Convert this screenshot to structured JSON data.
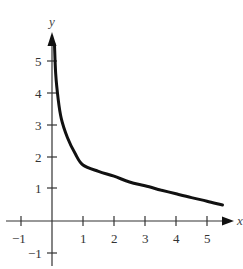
{
  "chart_data": {
    "type": "line",
    "title": "",
    "xlabel": "x",
    "ylabel": "y",
    "xlim": [
      -1.4,
      5.9
    ],
    "ylim": [
      -1.4,
      5.8
    ],
    "grid": false,
    "x_ticks": [
      -1,
      1,
      2,
      3,
      4,
      5
    ],
    "y_ticks": [
      -1,
      1,
      2,
      3,
      4,
      5
    ],
    "series": [
      {
        "name": "curve",
        "x": [
          0.08,
          0.12,
          0.2,
          0.3,
          0.5,
          0.75,
          1,
          1.5,
          2,
          2.5,
          3,
          3.5,
          4,
          4.5,
          5,
          5.5
        ],
        "y": [
          5.5,
          4.6,
          3.8,
          3.2,
          2.6,
          2.1,
          1.75,
          1.55,
          1.4,
          1.22,
          1.1,
          0.97,
          0.85,
          0.73,
          0.62,
          0.5
        ]
      }
    ],
    "line_color": "#111111"
  },
  "labels": {
    "x_axis": "x",
    "y_axis": "y",
    "x_ticks": [
      "−1",
      "1",
      "2",
      "3",
      "4",
      "5"
    ],
    "y_ticks": [
      "5",
      "4",
      "3",
      "2",
      "1",
      "−1"
    ]
  }
}
